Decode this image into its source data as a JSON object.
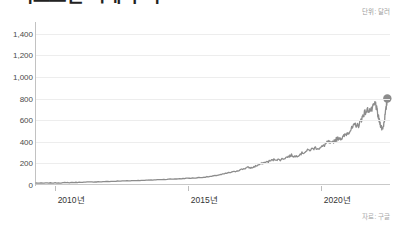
{
  "header": {
    "headline": "비트코인 시세 추이",
    "unit_label": "단위: 달러",
    "source_label": "자료: 구글"
  },
  "chart_data": {
    "type": "line",
    "title": "비트코인 시세 추이",
    "xlabel": "",
    "ylabel": "",
    "unit": "단위: 달러",
    "source": "자료: 구글",
    "grid": true,
    "legend": false,
    "line_color": "#8c8c8c",
    "endpoint_marker": true,
    "endpoint_marker_color": "#8c8c8c",
    "ylim": [
      0,
      1480
    ],
    "yticks": [
      0,
      200,
      400,
      600,
      800,
      1000,
      1200,
      1400
    ],
    "ytick_labels": [
      "0",
      "200",
      "400",
      "600",
      "800",
      "1,000",
      "1,200",
      "1,400"
    ],
    "xlim": [
      2009.3,
      2022.6
    ],
    "xticks": [
      2010,
      2015,
      2020
    ],
    "xtick_labels": [
      "2010년",
      "2015년",
      "2020년"
    ],
    "series": [
      {
        "name": "시세",
        "x": [
          2009.3,
          2009.6,
          2009.9,
          2010.2,
          2010.5,
          2010.8,
          2011.1,
          2011.4,
          2011.7,
          2012.0,
          2012.3,
          2012.6,
          2012.9,
          2013.2,
          2013.5,
          2013.8,
          2014.1,
          2014.4,
          2014.7,
          2015.0,
          2015.3,
          2015.6,
          2015.9,
          2016.1,
          2016.3,
          2016.5,
          2016.7,
          2016.9,
          2017.1,
          2017.25,
          2017.4,
          2017.55,
          2017.7,
          2017.85,
          2018.0,
          2018.15,
          2018.3,
          2018.45,
          2018.6,
          2018.75,
          2018.9,
          2019.05,
          2019.2,
          2019.35,
          2019.5,
          2019.65,
          2019.8,
          2019.95,
          2020.1,
          2020.2,
          2020.3,
          2020.4,
          2020.5,
          2020.6,
          2020.7,
          2020.8,
          2020.9,
          2021.0,
          2021.1,
          2021.2,
          2021.3,
          2021.4,
          2021.5,
          2021.55,
          2021.6,
          2021.7,
          2021.8,
          2021.9,
          2022.0,
          2022.05,
          2022.1,
          2022.15,
          2022.2,
          2022.25,
          2022.3,
          2022.35,
          2022.4,
          2022.45,
          2022.5
        ],
        "values": [
          18,
          18,
          19,
          20,
          22,
          24,
          26,
          28,
          30,
          32,
          35,
          38,
          40,
          42,
          45,
          48,
          52,
          55,
          58,
          62,
          66,
          72,
          80,
          90,
          98,
          112,
          120,
          135,
          150,
          162,
          158,
          175,
          190,
          205,
          215,
          228,
          238,
          232,
          245,
          260,
          275,
          262,
          285,
          300,
          318,
          330,
          345,
          340,
          360,
          385,
          398,
          380,
          410,
          425,
          440,
          430,
          460,
          482,
          505,
          530,
          560,
          545,
          590,
          620,
          655,
          680,
          700,
          690,
          730,
          760,
          700,
          640,
          590,
          555,
          520,
          545,
          620,
          700,
          800
        ]
      }
    ],
    "annotations": []
  }
}
